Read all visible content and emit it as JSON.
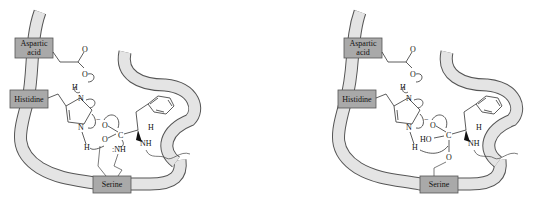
{
  "diagram": {
    "panels": [
      {
        "id": "left",
        "residues": {
          "aspartic": "Aspartic\nacid",
          "aspartic_line1": "Aspartic",
          "aspartic_line2": "acid",
          "histidine": "Histidine",
          "serine": "Serine"
        },
        "atoms": {
          "carbonyl_o_asp": "O",
          "asp_o": "O",
          "asp_h": "H",
          "his_n_top": "N",
          "his_n_bottom": "N",
          "his_h": "H",
          "oxyanion": "O",
          "oxyanion_charge": "−",
          "carbon": "C",
          "ser_o": "O",
          "leaving_nh": ":NH",
          "alpha_h": "H",
          "substrate_nh": "NH"
        }
      },
      {
        "id": "right",
        "residues": {
          "aspartic_line1": "Aspartic",
          "aspartic_line2": "acid",
          "histidine": "Histidine",
          "serine": "Serine"
        },
        "atoms": {
          "carbonyl_o_asp": "O",
          "asp_o": "O",
          "asp_h": "H",
          "his_n_top": "N",
          "his_n_bottom": "N",
          "his_h": "H",
          "oxyanion": "O",
          "oxyanion_charge": "−",
          "carbon": "C",
          "hydroxyl": "HO",
          "ser_o": "O",
          "alpha_h": "H",
          "substrate_nh": "NH"
        }
      }
    ]
  }
}
